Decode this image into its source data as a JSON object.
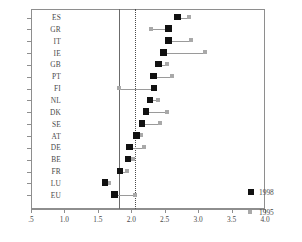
{
  "chart_data": {
    "type": "scatter",
    "title": "",
    "xlabel": "",
    "ylabel": "",
    "xlim": [
      0.5,
      4.0
    ],
    "xticks": [
      0.5,
      1.0,
      1.5,
      2.0,
      2.5,
      3.0,
      3.5,
      4.0
    ],
    "xtick_labels": [
      ".5",
      "1.0",
      "1.5",
      "2.0",
      "2.5",
      "3.0",
      "3.5",
      "4.0"
    ],
    "grid": false,
    "legend_position": "bottom-right",
    "categories": [
      "ES",
      "GR",
      "IT",
      "IE",
      "GB",
      "PT",
      "FI",
      "NL",
      "DK",
      "SE",
      "AT",
      "DE",
      "BE",
      "FR",
      "LU",
      "EU"
    ],
    "series": [
      {
        "name": "1998",
        "color": "#111111",
        "values": [
          2.69,
          2.56,
          2.56,
          2.48,
          2.41,
          2.33,
          2.34,
          2.28,
          2.22,
          2.16,
          2.08,
          1.97,
          1.95,
          1.83,
          1.61,
          1.75
        ]
      },
      {
        "name": "1995",
        "color": "#a9a9a9",
        "values": [
          2.86,
          2.3,
          2.9,
          3.11,
          2.53,
          2.61,
          1.82,
          2.4,
          2.53,
          2.43,
          2.14,
          2.19,
          2.02,
          1.94,
          1.67,
          2.06
        ]
      }
    ],
    "reference_lines": [
      {
        "name": "solid-reference-line",
        "value": 1.81,
        "style": "solid"
      },
      {
        "name": "dotted-reference-line",
        "value": 2.06,
        "style": "dotted"
      }
    ]
  },
  "legend": {
    "entries": [
      {
        "label": "1998"
      },
      {
        "label": "1995"
      }
    ]
  }
}
